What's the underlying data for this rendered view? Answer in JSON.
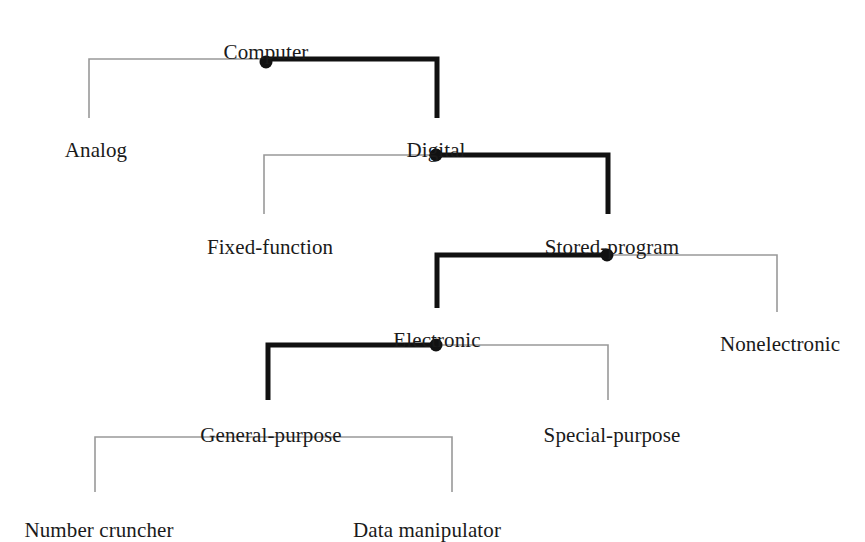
{
  "diagram": {
    "kind": "taxonomy-tree",
    "background_color": "#ffffff",
    "text_color": "#1a1a1a",
    "thick_line_color": "#111111",
    "thin_line_color": "#999999",
    "dot_color": "#111111",
    "thick_line_width": 5,
    "thin_line_width": 1.6,
    "dot_radius": 6.5,
    "nodes": [
      {
        "id": "computer",
        "label": "Computer",
        "x": 266,
        "y": 42,
        "level": 0
      },
      {
        "id": "analog",
        "label": "Analog",
        "x": 96,
        "y": 140,
        "level": 1
      },
      {
        "id": "digital",
        "label": "Digital",
        "x": 436,
        "y": 140,
        "level": 1
      },
      {
        "id": "fixed-function",
        "label": "Fixed-function",
        "x": 270,
        "y": 237,
        "level": 2
      },
      {
        "id": "stored-program",
        "label": "Stored-program",
        "x": 612,
        "y": 237,
        "level": 2
      },
      {
        "id": "electronic",
        "label": "Electronic",
        "x": 437,
        "y": 330,
        "level": 3
      },
      {
        "id": "nonelectronic",
        "label": "Nonelectronic",
        "x": 780,
        "y": 334,
        "level": 3
      },
      {
        "id": "general-purpose",
        "label": "General-purpose",
        "x": 271,
        "y": 425,
        "level": 4
      },
      {
        "id": "special-purpose",
        "label": "Special-purpose",
        "x": 612,
        "y": 425,
        "level": 4
      },
      {
        "id": "number-cruncher",
        "label": "Number cruncher",
        "x": 99,
        "y": 520,
        "level": 5
      },
      {
        "id": "data-manipulator",
        "label": "Data manipulator",
        "x": 427,
        "y": 520,
        "level": 5
      }
    ],
    "junctions": [
      {
        "id": "junction-computer",
        "parent": "computer",
        "x": 266,
        "y": 62,
        "dot": true
      },
      {
        "id": "junction-digital",
        "parent": "digital",
        "x": 436,
        "y": 155,
        "dot": true
      },
      {
        "id": "junction-stored-program",
        "parent": "stored-program",
        "x": 607,
        "y": 255,
        "dot": true
      },
      {
        "id": "junction-electronic",
        "parent": "electronic",
        "x": 436,
        "y": 345,
        "dot": true
      },
      {
        "id": "junction-general-purpose",
        "parent": "general-purpose",
        "x": 271,
        "y": 437,
        "dot": false
      }
    ],
    "connectors": [
      {
        "id": "connector-computer-analog",
        "from": "computer",
        "to": "analog",
        "weight": "thin",
        "bus_y": 59,
        "junction_x": 266,
        "end_x": 89,
        "drop_y": 118
      },
      {
        "id": "connector-computer-digital",
        "from": "computer",
        "to": "digital",
        "weight": "thick",
        "bus_y": 59,
        "junction_x": 266,
        "end_x": 437,
        "drop_y": 118
      },
      {
        "id": "connector-digital-fixed-function",
        "from": "digital",
        "to": "fixed-function",
        "weight": "thin",
        "bus_y": 155,
        "junction_x": 436,
        "end_x": 264,
        "drop_y": 214
      },
      {
        "id": "connector-digital-stored-program",
        "from": "digital",
        "to": "stored-program",
        "weight": "thick",
        "bus_y": 155,
        "junction_x": 436,
        "end_x": 608,
        "drop_y": 214
      },
      {
        "id": "connector-stored-program-electronic",
        "from": "stored-program",
        "to": "electronic",
        "weight": "thick",
        "bus_y": 255,
        "junction_x": 607,
        "end_x": 437,
        "drop_y": 308
      },
      {
        "id": "connector-stored-program-nonelectronic",
        "from": "stored-program",
        "to": "nonelectronic",
        "weight": "thin",
        "bus_y": 255,
        "junction_x": 607,
        "end_x": 777,
        "drop_y": 312
      },
      {
        "id": "connector-electronic-general-purpose",
        "from": "electronic",
        "to": "general-purpose",
        "weight": "thick",
        "bus_y": 345,
        "junction_x": 436,
        "end_x": 268,
        "drop_y": 400
      },
      {
        "id": "connector-electronic-special-purpose",
        "from": "electronic",
        "to": "special-purpose",
        "weight": "thin",
        "bus_y": 345,
        "junction_x": 436,
        "end_x": 608,
        "drop_y": 400
      },
      {
        "id": "connector-general-number-cruncher",
        "from": "general-purpose",
        "to": "number-cruncher",
        "weight": "thin",
        "bus_y": 437,
        "junction_x": 271,
        "end_x": 95,
        "drop_y": 492
      },
      {
        "id": "connector-general-data-manipulator",
        "from": "general-purpose",
        "to": "data-manipulator",
        "weight": "thin",
        "bus_y": 437,
        "junction_x": 271,
        "end_x": 452,
        "drop_y": 492
      }
    ]
  }
}
